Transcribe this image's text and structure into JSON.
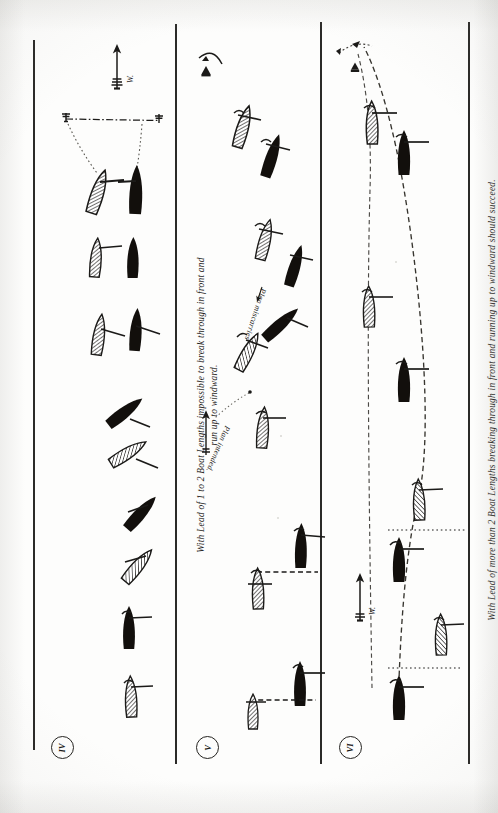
{
  "page": {
    "kind": "scanned-book-illustration",
    "orientation": "rotated-90",
    "background": "#fdfdfc",
    "ink": "#1b1a18"
  },
  "panels": [
    {
      "id": "panel-1",
      "figure_number": "IV",
      "caption": "",
      "wind_label": "W.",
      "notes": ""
    },
    {
      "id": "panel-2",
      "figure_number": "V",
      "caption": "With Lead of 1 to 2 Boat Lengths impossible to break through in front and\nrun up to windward.",
      "annotations": [
        {
          "id": "plan-intended",
          "text": "Plan intended."
        },
        {
          "id": "plan-miscarries",
          "text": "Plan miscarries"
        }
      ]
    },
    {
      "id": "panel-3",
      "figure_number": "VI",
      "caption": "With Lead of more than 2 Boat Lengths breaking through in front and running up to windward should succeed.",
      "wind_label": "W."
    }
  ],
  "legend": {
    "hatched_boat": "leeward boat (hatched hull)",
    "solid_boat": "windward boat (solid black hull)",
    "dashed_track": "course sailed",
    "dotted_reference": "relative position reference line",
    "arrow": "wind direction"
  }
}
